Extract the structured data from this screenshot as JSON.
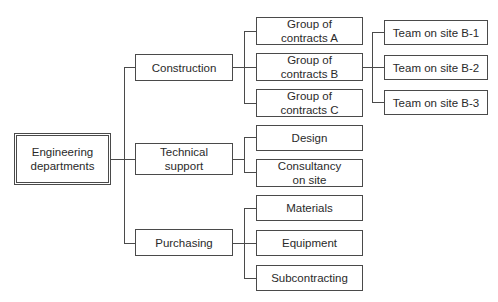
{
  "diagram": {
    "type": "org-chart",
    "root": {
      "label": "Engineering departments",
      "line1": "Engineering",
      "line2": "departments"
    },
    "departments": [
      {
        "label": "Construction",
        "children": [
          {
            "line1": "Group of",
            "line2": "contracts A"
          },
          {
            "line1": "Group of",
            "line2": "contracts B",
            "children": [
              {
                "label": "Team on site B-1"
              },
              {
                "label": "Team on site B-2"
              },
              {
                "label": "Team on site B-3"
              }
            ]
          },
          {
            "line1": "Group of",
            "line2": "contracts C"
          }
        ]
      },
      {
        "line1": "Technical",
        "line2": "support",
        "children": [
          {
            "label": "Design"
          },
          {
            "line1": "Consultancy",
            "line2": "on site"
          }
        ]
      },
      {
        "label": "Purchasing",
        "children": [
          {
            "label": "Materials"
          },
          {
            "label": "Equipment"
          },
          {
            "label": "Subcontracting"
          }
        ]
      }
    ]
  }
}
